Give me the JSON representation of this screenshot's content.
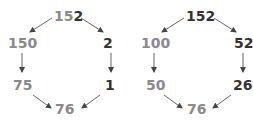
{
  "colors": {
    "gray": "#8a8a8a",
    "dark": "#333333",
    "arrow": "#444444"
  },
  "left": {
    "top_a": "15",
    "top_b": "2",
    "upper_left": "150",
    "upper_right": "2",
    "lower_left": "75",
    "lower_right": "1",
    "bottom": "76"
  },
  "right": {
    "top": "152",
    "upper_left": "100",
    "upper_right": "52",
    "lower_left": "50",
    "lower_right": "26",
    "bottom": "76"
  }
}
